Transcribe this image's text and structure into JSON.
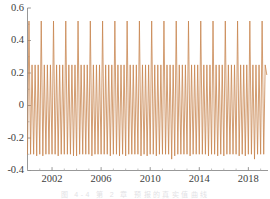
{
  "chart_data": {
    "type": "line",
    "title": "",
    "subtitle": "",
    "xlabel": "",
    "ylabel": "",
    "xlim": [
      2000.0,
      2019.6
    ],
    "ylim": [
      -0.4,
      0.6
    ],
    "grid": false,
    "legend": null,
    "legend_position": "none",
    "line_color": "#C8854F",
    "line_width": 0.8,
    "x_ticks_major": [
      2002,
      2006,
      2010,
      2014,
      2018
    ],
    "x_tick_labels": [
      "2002",
      "2006",
      "2010",
      "2014",
      "2018"
    ],
    "x_ticks_minor": [
      2000,
      2001,
      2003,
      2004,
      2005,
      2007,
      2008,
      2009,
      2011,
      2012,
      2013,
      2015,
      2016,
      2017,
      2019
    ],
    "y_ticks_major": [
      0.6,
      0.4,
      0.2,
      0,
      -0.2,
      -0.4
    ],
    "y_tick_labels": [
      "0.6",
      "0.4",
      "0.2",
      "0",
      "-0.2",
      "-0.4"
    ],
    "y_ticks_minor": [
      0.5,
      0.3,
      0.1,
      -0.1,
      -0.3
    ],
    "peak_high": 0.52,
    "peak_low": 0.25,
    "trough_typical": -0.3,
    "trough_deep": -0.33,
    "cycles_per_year": 4,
    "series": [
      {
        "name": "signal",
        "color": "#C8854F",
        "x": [
          2000.0,
          2000.12,
          2000.25,
          2000.37,
          2000.5,
          2000.62,
          2000.75,
          2000.87,
          2001.0,
          2001.12,
          2001.25,
          2001.37,
          2001.5,
          2001.62,
          2001.75,
          2001.87,
          2002.0,
          2002.12,
          2002.25,
          2002.37,
          2002.5,
          2002.62,
          2002.75,
          2002.87,
          2003.0,
          2003.12,
          2003.25,
          2003.37,
          2003.5,
          2003.62,
          2003.75,
          2003.87,
          2004.0,
          2004.12,
          2004.25,
          2004.37,
          2004.5,
          2004.62,
          2004.75,
          2004.87,
          2005.0,
          2005.12,
          2005.25,
          2005.37,
          2005.5,
          2005.62,
          2005.75,
          2005.87,
          2006.0,
          2006.12,
          2006.25,
          2006.37,
          2006.5,
          2006.62,
          2006.75,
          2006.87,
          2007.0,
          2007.12,
          2007.25,
          2007.37,
          2007.5,
          2007.62,
          2007.75,
          2007.87,
          2008.0,
          2008.12,
          2008.25,
          2008.37,
          2008.5,
          2008.62,
          2008.75,
          2008.87,
          2009.0,
          2009.12,
          2009.25,
          2009.37,
          2009.5,
          2009.62,
          2009.75,
          2009.87,
          2010.0,
          2010.12,
          2010.25,
          2010.37,
          2010.5,
          2010.62,
          2010.75,
          2010.87,
          2011.0,
          2011.12,
          2011.25,
          2011.37,
          2011.5,
          2011.62,
          2011.75,
          2011.87,
          2012.0,
          2012.12,
          2012.25,
          2012.37,
          2012.5,
          2012.62,
          2012.75,
          2012.87,
          2013.0,
          2013.12,
          2013.25,
          2013.37,
          2013.5,
          2013.62,
          2013.75,
          2013.87,
          2014.0,
          2014.12,
          2014.25,
          2014.37,
          2014.5,
          2014.62,
          2014.75,
          2014.87,
          2015.0,
          2015.12,
          2015.25,
          2015.37,
          2015.5,
          2015.62,
          2015.75,
          2015.87,
          2016.0,
          2016.12,
          2016.25,
          2016.37,
          2016.5,
          2016.62,
          2016.75,
          2016.87,
          2017.0,
          2017.12,
          2017.25,
          2017.37,
          2017.5,
          2017.62,
          2017.75,
          2017.87,
          2018.0,
          2018.12,
          2018.25,
          2018.37,
          2018.5,
          2018.62,
          2018.75,
          2018.87,
          2019.0,
          2019.12,
          2019.25,
          2019.37,
          2019.5
        ],
        "values": [
          -0.3,
          0.52,
          -0.3,
          0.25,
          -0.3,
          0.25,
          -0.31,
          0.25,
          -0.3,
          0.52,
          -0.31,
          0.25,
          -0.3,
          0.25,
          -0.3,
          0.25,
          -0.3,
          0.52,
          -0.3,
          0.25,
          -0.31,
          0.25,
          -0.3,
          0.25,
          -0.3,
          0.52,
          -0.3,
          0.25,
          -0.3,
          0.25,
          -0.31,
          0.25,
          -0.31,
          0.52,
          -0.3,
          0.25,
          -0.3,
          0.25,
          -0.3,
          0.25,
          -0.3,
          0.52,
          -0.31,
          0.25,
          -0.3,
          0.25,
          -0.3,
          0.25,
          -0.3,
          0.52,
          -0.3,
          0.25,
          -0.3,
          0.25,
          -0.31,
          0.25,
          -0.3,
          0.52,
          -0.3,
          0.25,
          -0.31,
          0.25,
          -0.3,
          0.25,
          -0.31,
          0.52,
          -0.3,
          0.25,
          -0.3,
          0.25,
          -0.3,
          0.25,
          -0.3,
          0.52,
          -0.31,
          0.25,
          -0.3,
          0.25,
          -0.31,
          0.25,
          -0.3,
          0.52,
          -0.3,
          0.25,
          -0.31,
          0.25,
          -0.3,
          0.25,
          -0.3,
          0.52,
          -0.3,
          0.25,
          -0.3,
          0.25,
          -0.33,
          0.25,
          -0.31,
          0.52,
          -0.3,
          0.25,
          -0.3,
          0.25,
          -0.3,
          0.25,
          -0.3,
          0.52,
          -0.31,
          0.25,
          -0.3,
          0.25,
          -0.3,
          0.25,
          -0.3,
          0.52,
          -0.3,
          0.25,
          -0.3,
          0.25,
          -0.31,
          0.25,
          -0.3,
          0.52,
          -0.3,
          0.25,
          -0.31,
          0.25,
          -0.3,
          0.25,
          -0.31,
          0.52,
          -0.3,
          0.25,
          -0.3,
          0.25,
          -0.3,
          0.25,
          -0.3,
          0.52,
          -0.31,
          0.25,
          -0.3,
          0.25,
          -0.31,
          0.25,
          -0.3,
          0.52,
          -0.3,
          0.25,
          -0.33,
          0.25,
          -0.3,
          0.25,
          -0.3,
          0.52,
          -0.3,
          0.25,
          0.19
        ]
      }
    ]
  },
  "axes": {
    "y_labels": [
      "0.6",
      "0.4",
      "0.2",
      "0",
      "-0.2",
      "-0.4"
    ],
    "x_labels": [
      "2002",
      "2006",
      "2010",
      "2014",
      "2018"
    ]
  },
  "caption": {
    "text": "图 4-4   第 2 章    预报的真实值曲线"
  },
  "colors": {
    "line": "#C8854F",
    "axis": "#8c8c8c",
    "tick": "#9a9a9a",
    "text": "#404040",
    "background": "#ffffff"
  }
}
